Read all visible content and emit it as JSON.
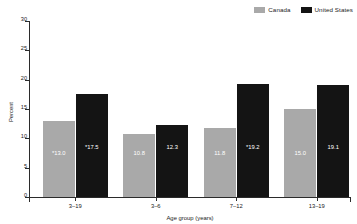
{
  "chart_data": {
    "type": "bar",
    "title": "",
    "subtitle": "",
    "xlabel": "Age group (years)",
    "ylabel": "Percent",
    "categories": [
      "3–19",
      "3–6",
      "7–12",
      "13–19"
    ],
    "series": [
      {
        "name": "Canada",
        "color": "#a9a9a9",
        "values": [
          13.0,
          10.8,
          11.8,
          15.0
        ],
        "labels": [
          "*13.0",
          "10.8",
          "11.8",
          "15.0"
        ]
      },
      {
        "name": "United States",
        "color": "#141414",
        "values": [
          17.5,
          12.3,
          19.2,
          19.1
        ],
        "labels": [
          "*17.5",
          "12.3",
          "*19.2",
          "19.1"
        ]
      }
    ],
    "ylim": [
      0,
      30
    ],
    "yticks": [
      0,
      5,
      10,
      15,
      20,
      25,
      30
    ],
    "ytick_labels": [
      "0",
      "5",
      "10",
      "15",
      "20",
      "25",
      "30"
    ],
    "grid": false,
    "legend_position": "top-right"
  },
  "legend": {
    "entries": [
      {
        "label": "Canada",
        "color": "#a9a9a9"
      },
      {
        "label": "United States",
        "color": "#141414"
      }
    ]
  }
}
